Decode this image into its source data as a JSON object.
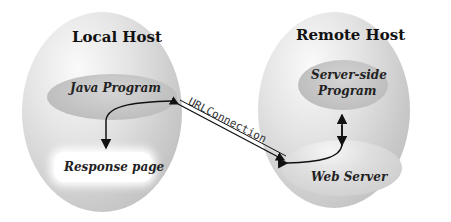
{
  "diagram": {
    "local_host": {
      "title": "Local Host",
      "java_program": "Java Program",
      "response_page": "Response page"
    },
    "remote_host": {
      "title": "Remote Host",
      "server_program_line1": "Server-side",
      "server_program_line2": "Program",
      "web_server": "Web Server"
    },
    "connection_label": "URLConnection"
  }
}
